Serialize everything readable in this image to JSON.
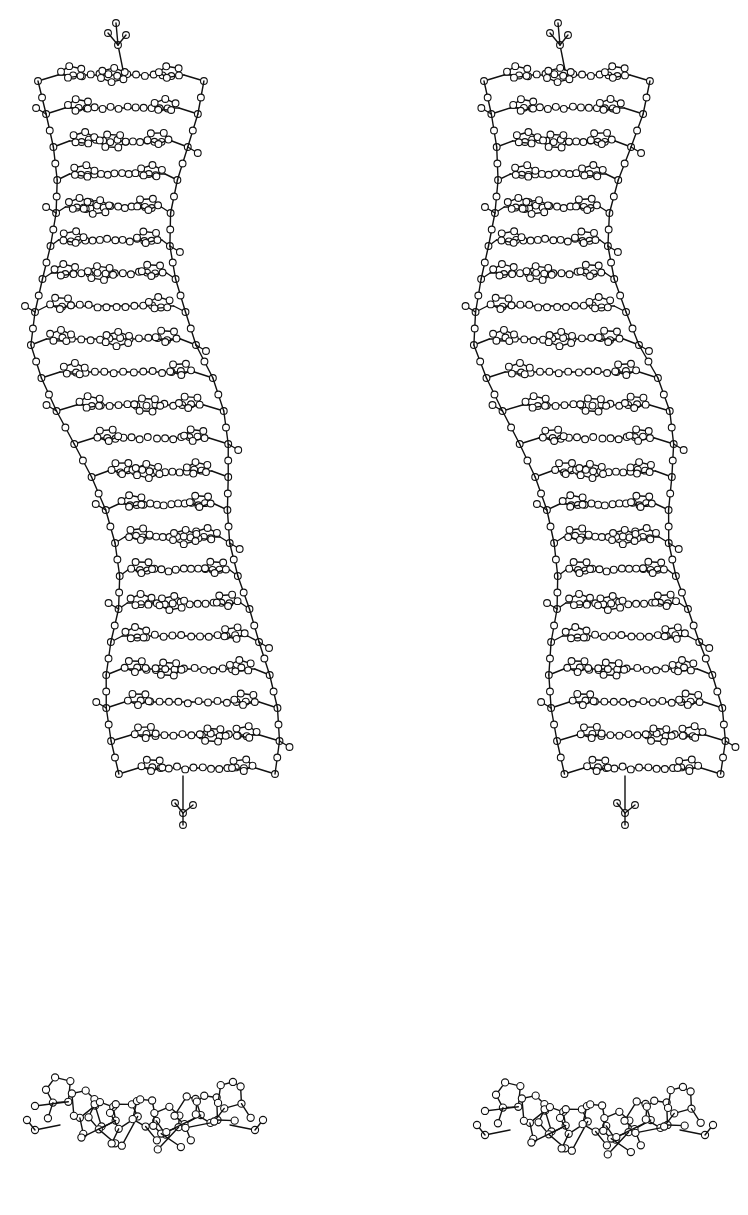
{
  "figure": {
    "kind": "stereo-pair molecular model",
    "background": "#ffffff",
    "ink": "#111111",
    "panels": [
      {
        "id": "side-view-left",
        "role": "side view (left eye)",
        "x0": 48,
        "top": 30,
        "bottom": 880
      },
      {
        "id": "side-view-right",
        "role": "side view (right eye)",
        "x0": 490,
        "top": 20,
        "bottom": 885
      },
      {
        "id": "end-view-left",
        "role": "end view (left eye)",
        "cx": 145,
        "cy": 1125
      },
      {
        "id": "end-view-right",
        "role": "end view (right eye)",
        "cx": 595,
        "cy": 1130
      }
    ],
    "helix": {
      "layers": 22,
      "layer_spacing": 33,
      "first_layer_y": 75,
      "width": 135,
      "stereo_shift": 8,
      "kink": {
        "start_layer": 11,
        "shift_per_layer": 7.5,
        "max_shift": 75
      }
    },
    "end_view": {
      "ring_count": 9,
      "ring_radius": 14,
      "width": 210
    }
  }
}
